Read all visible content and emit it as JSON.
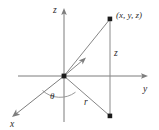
{
  "figure": {
    "background_color": "#ffffff",
    "axis_color": "#7d7d7d",
    "ray_color": "#868686",
    "marker_color": "#1b1b1b",
    "label_color": "#2b2b2b",
    "labels": {
      "z_axis": "z",
      "y_axis": "y",
      "x_axis": "x",
      "point": "(x, y, z)",
      "height_segment": "z",
      "radial_segment": "r",
      "angle": "θ"
    },
    "geometry": {
      "origin": {
        "x": 64,
        "y": 76
      },
      "point_3d": {
        "x": 110,
        "y": 19
      },
      "point_projection": {
        "x": 110,
        "y": 116
      },
      "z_axis_top": {
        "x": 64,
        "y": 8
      },
      "z_axis_bottom": {
        "x": 64,
        "y": 122
      },
      "y_axis_left": {
        "x": 18,
        "y": 76
      },
      "y_axis_right": {
        "x": 148,
        "y": 76
      },
      "x_axis_end": {
        "x": 12,
        "y": 117
      },
      "tick_ray_end": {
        "x": 85,
        "y": 58
      }
    }
  }
}
